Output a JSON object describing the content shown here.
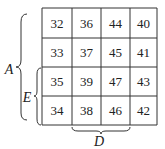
{
  "grid": {
    "rows": [
      [
        "32",
        "36",
        "44",
        "40"
      ],
      [
        "33",
        "37",
        "45",
        "41"
      ],
      [
        "35",
        "39",
        "47",
        "43"
      ],
      [
        "34",
        "38",
        "46",
        "42"
      ]
    ]
  },
  "labels": {
    "A": "A",
    "E": "E",
    "D": "D"
  },
  "braces": {
    "A": {
      "spans_rows": [
        1,
        4
      ]
    },
    "E": {
      "spans_rows": [
        3,
        4
      ]
    },
    "D": {
      "spans_columns": [
        2,
        3
      ]
    }
  }
}
